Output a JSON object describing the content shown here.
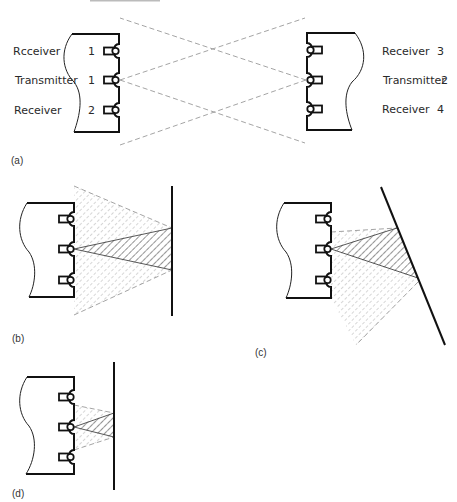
{
  "header": {
    "partial_text": ""
  },
  "panels": {
    "a": {
      "caption": "(a)",
      "left_labels": [
        {
          "name": "Rcceiver",
          "number": "1"
        },
        {
          "name": "Transmitter",
          "number": "1"
        },
        {
          "name": "Receiver",
          "number": "2"
        }
      ],
      "right_labels": [
        {
          "name": "Receiver",
          "number": "3"
        },
        {
          "name": "Transmitter",
          "number": "2"
        },
        {
          "name": "Receiver",
          "number": "4"
        }
      ]
    },
    "b": {
      "caption": "(b)",
      "description": "Parallel wall, wide reflection cone"
    },
    "c": {
      "caption": "(c)",
      "description": "Tilted wall, skewed reflection cone"
    },
    "d": {
      "caption": "(d)",
      "description": "Close parallel wall, narrow reflection cone"
    }
  },
  "colors": {
    "ink": "#111111",
    "dash": "#9a9a9a",
    "hatch": "#555555",
    "background": "#ffffff"
  }
}
